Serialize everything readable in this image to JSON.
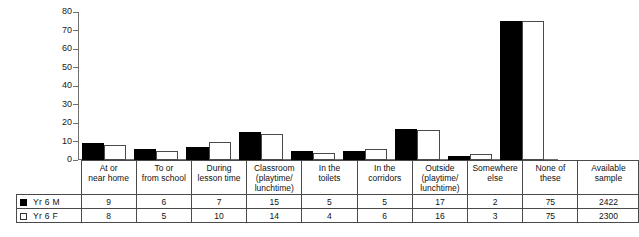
{
  "chart_data": {
    "type": "bar",
    "title": "",
    "xlabel": "",
    "ylabel": "",
    "ylim": [
      0,
      80
    ],
    "yticks": [
      0,
      10,
      20,
      30,
      40,
      50,
      60,
      70,
      80
    ],
    "grid": false,
    "legend_position": "bottom-left-table",
    "categories": [
      "At or near home",
      "To or from school",
      "During lesson time",
      "Classroom (playtime/ lunchtime)",
      "In the toilets",
      "In the corridors",
      "Outside (playtime/ lunchtime)",
      "Somewhere else",
      "None of these"
    ],
    "category_lines": [
      [
        "At or",
        "near home"
      ],
      [
        "To or",
        "from school"
      ],
      [
        "During",
        "lesson time"
      ],
      [
        "Classroom",
        "(playtime/",
        "lunchtime)"
      ],
      [
        "In the",
        "toilets"
      ],
      [
        "In the",
        "corridors"
      ],
      [
        "Outside",
        "(playtime/",
        "lunchtime)"
      ],
      [
        "Somewhere",
        "else"
      ],
      [
        "None of these"
      ]
    ],
    "series": [
      {
        "name": "Yr 6 M",
        "color": "#000000",
        "values": [
          9,
          6,
          7,
          15,
          5,
          5,
          17,
          2,
          75
        ]
      },
      {
        "name": "Yr 6 F",
        "color": "#ffffff",
        "values": [
          8,
          5,
          10,
          14,
          4,
          6,
          16,
          3,
          75
        ]
      }
    ]
  },
  "table": {
    "sample_header_lines": [
      "Available",
      "sample"
    ],
    "rows": [
      {
        "label": "Yr 6 M",
        "swatch": "filled-square-icon",
        "values": [
          9,
          6,
          7,
          15,
          5,
          5,
          17,
          2,
          75
        ],
        "sample": "2422"
      },
      {
        "label": "Yr 6 F",
        "swatch": "empty-square-icon",
        "values": [
          8,
          5,
          10,
          14,
          4,
          6,
          16,
          3,
          75
        ],
        "sample": "2300"
      }
    ]
  },
  "axis": {
    "tick_labels": [
      "80",
      "70",
      "60",
      "50",
      "40",
      "30",
      "20",
      "10",
      "0"
    ]
  }
}
